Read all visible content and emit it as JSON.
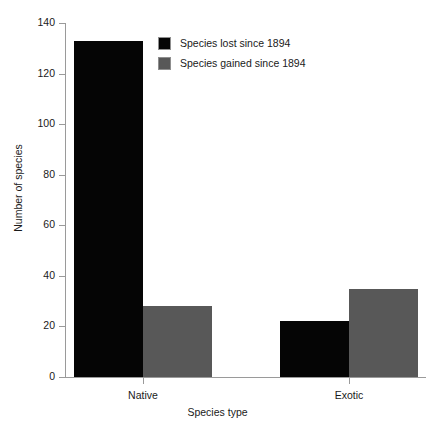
{
  "chart_data": {
    "type": "bar",
    "title": "",
    "subtitle": "",
    "xlabel": "Species type",
    "ylabel": "Number of species",
    "categories": [
      "Native",
      "Exotic"
    ],
    "series": [
      {
        "name": "Species lost since 1894",
        "color": "#050505",
        "values": [
          133,
          22
        ]
      },
      {
        "name": "Species gained since 1894",
        "color": "#585858",
        "values": [
          28,
          35
        ]
      }
    ],
    "ylim": [
      0,
      140
    ],
    "yticks": [
      0,
      20,
      40,
      60,
      80,
      100,
      120,
      140
    ],
    "ytick_labels": [
      "0",
      "20",
      "40",
      "60",
      "80",
      "100",
      "120",
      "140"
    ],
    "grid": false,
    "legend_position": "top-center",
    "grouped": true,
    "bar_style": "adjacent-within-group"
  },
  "legend": {
    "entries": [
      {
        "label": "Species lost since 1894",
        "swatch": "black-square-swatch"
      },
      {
        "label": "Species gained since 1894",
        "swatch": "gray-square-swatch"
      }
    ]
  },
  "axes": {
    "x_title": "Species type",
    "y_title": "Number of species",
    "x_tick_labels": [
      "Native",
      "Exotic"
    ],
    "y_tick_labels": [
      "0",
      "20",
      "40",
      "60",
      "80",
      "100",
      "120",
      "140"
    ]
  },
  "colors": {
    "lost": "#050505",
    "gained": "#585858",
    "axis": "#9a9a9a",
    "background": "#ffffff",
    "text": "#1a1a1a"
  }
}
